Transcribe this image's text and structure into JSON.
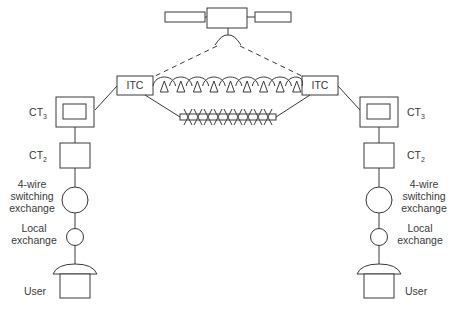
{
  "diagram": {
    "colors": {
      "line": "#3a3a3a",
      "text": "#3a3a3a",
      "background": "#ffffff"
    },
    "satellite": {
      "name": "satellite"
    },
    "international_link": {
      "left_node": "ITC",
      "right_node": "ITC",
      "upper_route": "radio relay / microwave chain",
      "lower_route": "submarine cable with repeaters",
      "satellite_route": "dashed satellite path"
    },
    "left_side": {
      "ct3": {
        "base": "CT",
        "sub": "3"
      },
      "ct2": {
        "base": "CT",
        "sub": "2"
      },
      "four_wire": [
        "4-wire",
        "switching",
        "exchange"
      ],
      "local": [
        "Local",
        "exchange"
      ],
      "user": "User"
    },
    "right_side": {
      "ct3": {
        "base": "CT",
        "sub": "3"
      },
      "ct2": {
        "base": "CT",
        "sub": "2"
      },
      "four_wire": [
        "4-wire",
        "switching",
        "exchange"
      ],
      "local": [
        "Local",
        "exchange"
      ],
      "user": "User"
    }
  }
}
